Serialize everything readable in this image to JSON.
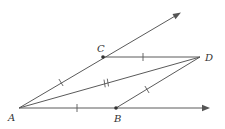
{
  "diagram": {
    "title": "",
    "points": {
      "A": {
        "label": "A",
        "x": 19,
        "y": 108
      },
      "B": {
        "label": "B",
        "x": 116,
        "y": 108
      },
      "C": {
        "label": "C",
        "x": 103,
        "y": 57
      },
      "D": {
        "label": "D",
        "x": 200,
        "y": 57
      }
    },
    "rays": [
      {
        "name": "ray-AC",
        "from": "A",
        "through": "C",
        "tip": [
          180,
          13
        ]
      },
      {
        "name": "ray-AB",
        "from": "A",
        "through": "B",
        "tip": [
          210,
          108
        ]
      }
    ],
    "segments": [
      {
        "name": "segment-CD",
        "from": "C",
        "to": "D",
        "ticks": 1
      },
      {
        "name": "segment-BD",
        "from": "B",
        "to": "D",
        "ticks": 1
      },
      {
        "name": "segment-AD",
        "from": "A",
        "to": "D",
        "ticks": 2
      },
      {
        "name": "segment-AC",
        "from": "A",
        "to": "C",
        "ticks": 1
      },
      {
        "name": "segment-AB",
        "from": "A",
        "to": "B",
        "ticks": 1
      }
    ],
    "labels": {
      "A": "A",
      "B": "B",
      "C": "C",
      "D": "D"
    },
    "colors": {
      "line": "#5a5a5a",
      "point": "#333333",
      "label": "#333333",
      "background": "#ffffff"
    }
  }
}
